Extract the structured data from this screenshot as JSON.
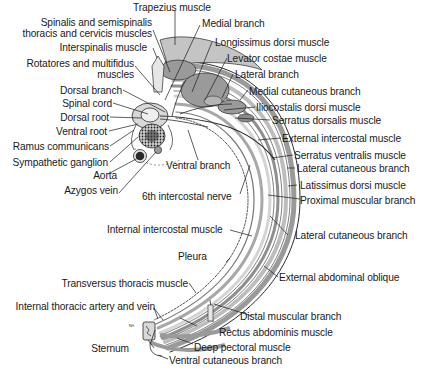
{
  "diagram": {
    "colors": {
      "background": "#ffffff",
      "muscle_fill": "#9a9a9a",
      "muscle_light": "#cfcfcf",
      "outline": "#2a2a2a",
      "text": "#1a1a1a"
    },
    "labels": {
      "trapezius": "Trapezius muscle",
      "spinalis_1": "Spinalis and semispinalis",
      "spinalis_2": "thoracis and cervicis muscles",
      "medial_branch": "Medial branch",
      "interspinalis": "Interspinalis muscle",
      "longissimus": "Longissimus dorsi muscle",
      "rotatores_1": "Rotatores and multifidus",
      "rotatores_2": "muscles",
      "levator": "Levator costae muscle",
      "lateral_branch": "Lateral branch",
      "dorsal_branch": "Dorsal branch",
      "medial_cutaneous": "Medial cutaneous branch",
      "spinal_cord": "Spinal cord",
      "iliocostalis": "Iliocostalis dorsi muscle",
      "dorsal_root": "Dorsal root",
      "serratus_dorsalis": "Serratus dorsalis muscle",
      "ventral_root": "Ventral root",
      "external_intercostal": "External intercostal muscle",
      "ramus": "Ramus communicans",
      "serratus_ventralis": "Serratus ventralis muscle",
      "sympathetic": "Sympathetic ganglion",
      "ventral_branch": "Ventral branch",
      "lateral_cutaneous_1": "Lateral cutaneous branch",
      "aorta": "Aorta",
      "latissimus": "Latissimus dorsi muscle",
      "azygos": "Azygos vein",
      "sixth_nerve": "6th intercostal nerve",
      "proximal_muscular": "Proximal muscular branch",
      "internal_intercostal": "Internal intercostal muscle",
      "lateral_cutaneous_2": "Lateral cutaneous branch",
      "pleura": "Pleura",
      "external_oblique": "External abdominal oblique",
      "transversus": "Transversus thoracis muscle",
      "internal_thoracic": "Internal thoracic artery and vein",
      "distal_muscular": "Distal muscular branch",
      "rectus": "Rectus abdominis muscle",
      "sternum": "Sternum",
      "deep_pectoral": "Deep pectoral muscle",
      "ventral_cutaneous": "Ventral cutaneous branch",
      "stray_mark": "ᴺᴬ"
    }
  }
}
